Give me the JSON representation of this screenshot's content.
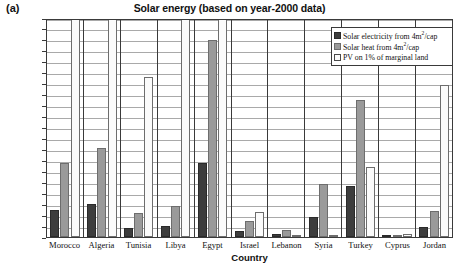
{
  "panel_label": "(a)",
  "chart_data": {
    "type": "bar",
    "title": "Solar energy (based on year-2000 data)",
    "xlabel": "Country",
    "ylabel": "MW",
    "ylim": [
      0,
      40000
    ],
    "ytick_step": 2000,
    "yticks": [
      40000,
      38000,
      36000,
      34000,
      32000,
      30000,
      28000,
      26000,
      24000,
      22000,
      20000,
      18000,
      16000,
      14000,
      12000,
      10000,
      8000,
      6000,
      4000,
      2000,
      0
    ],
    "grid": true,
    "legend_position": "top-right",
    "categories": [
      "Morocco",
      "Algeria",
      "Tunisia",
      "Libya",
      "Egypt",
      "Israel",
      "Lebanon",
      "Syria",
      "Turkey",
      "Cyprus",
      "Jordan"
    ],
    "series": [
      {
        "name": "Solar electricity from 4m²/cap",
        "color": "#3d3d3d",
        "values": [
          5000,
          6100,
          1600,
          2100,
          13600,
          1100,
          500,
          3700,
          9400,
          200,
          1800
        ]
      },
      {
        "name": "Solar heat from 4m²/cap",
        "color": "#9a9a9a",
        "values": [
          13500,
          16300,
          4300,
          5600,
          36000,
          2900,
          1300,
          9700,
          25000,
          400,
          4700
        ]
      },
      {
        "name": "PV on 1% of marginal land",
        "color": "#fbfbfb",
        "values": [
          44000,
          43000,
          29300,
          42000,
          45000,
          4500,
          300,
          300,
          12700,
          500,
          27700
        ],
        "clipped_note": "Morocco, Algeria, Libya and Egypt PV bars extend beyond the 40000 axis maximum"
      }
    ]
  },
  "legend": {
    "items": [
      {
        "label_pre": "Solar electricity from 4m",
        "label_sup": "2",
        "label_post": "/cap",
        "swatch": "s1"
      },
      {
        "label_pre": "Solar heat from 4m",
        "label_sup": "2",
        "label_post": "/cap",
        "swatch": "s2"
      },
      {
        "label_pre": "PV on 1% of marginal land",
        "label_sup": "",
        "label_post": "",
        "swatch": "s3"
      }
    ]
  }
}
